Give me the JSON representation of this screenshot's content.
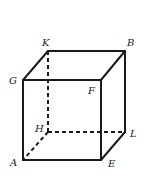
{
  "diagram": {
    "type": "cube",
    "vertices": {
      "K": {
        "x": 48,
        "y": 51,
        "label_x": 42,
        "label_y": 46
      },
      "B": {
        "x": 125,
        "y": 51,
        "label_x": 127,
        "label_y": 46
      },
      "G": {
        "x": 23,
        "y": 80,
        "label_x": 9,
        "label_y": 84
      },
      "F": {
        "x": 101,
        "y": 80,
        "label_x": 88,
        "label_y": 94
      },
      "H": {
        "x": 48,
        "y": 132,
        "label_x": 35,
        "label_y": 132
      },
      "L": {
        "x": 125,
        "y": 132,
        "label_x": 130,
        "label_y": 137
      },
      "A": {
        "x": 23,
        "y": 160,
        "label_x": 10,
        "label_y": 166
      },
      "E": {
        "x": 101,
        "y": 160,
        "label_x": 108,
        "label_y": 167
      }
    },
    "labels": [
      "K",
      "B",
      "G",
      "F",
      "H",
      "L",
      "A",
      "E"
    ],
    "solid_edges": [
      [
        "G",
        "F"
      ],
      [
        "K",
        "B"
      ],
      [
        "G",
        "K"
      ],
      [
        "F",
        "B"
      ],
      [
        "G",
        "A"
      ],
      [
        "F",
        "E"
      ],
      [
        "A",
        "E"
      ],
      [
        "B",
        "L"
      ],
      [
        "E",
        "L"
      ]
    ],
    "dashed_edges": [
      [
        "K",
        "H"
      ],
      [
        "H",
        "L"
      ],
      [
        "H",
        "A"
      ]
    ]
  }
}
